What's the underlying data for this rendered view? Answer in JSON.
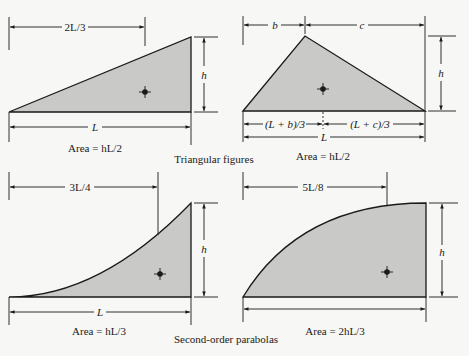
{
  "figure": {
    "group_labels": {
      "triangles": "Triangular figures",
      "parabolas": "Second-order parabolas"
    },
    "panels": [
      {
        "id": "right-triangle",
        "shape": "triangle",
        "dims": {
          "top": "2L/3",
          "base": "L",
          "height": "h"
        },
        "area": "Area = hL/2"
      },
      {
        "id": "general-triangle",
        "shape": "triangle",
        "dims": {
          "top_left": "b",
          "top_right": "c",
          "centroid_left": "(L + b)/3",
          "centroid_right": "(L + c)/3",
          "base": "L",
          "height": "h"
        },
        "area": "Area = hL/2"
      },
      {
        "id": "concave-parabola",
        "shape": "second-order parabola (spandrel)",
        "dims": {
          "top": "3L/4",
          "base": "L",
          "height": "h"
        },
        "area": "Area = hL/3"
      },
      {
        "id": "convex-parabola",
        "shape": "second-order parabola (semi-segment)",
        "dims": {
          "top": "5L/8",
          "height": "h"
        },
        "area": "Area = 2hL/3"
      }
    ],
    "colors": {
      "fill": "#c9c9c7",
      "stroke": "#1a1a1a",
      "background": "#f7f7f5"
    }
  }
}
